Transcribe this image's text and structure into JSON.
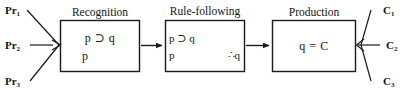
{
  "diagram": {
    "background_color": "#ffffff",
    "stroke_color": "#1a1a1a",
    "premises": [
      {
        "label": "Pr",
        "subscript": "1"
      },
      {
        "label": "Pr",
        "subscript": "2"
      },
      {
        "label": "Pr",
        "subscript": "3"
      }
    ],
    "conclusions": [
      {
        "label": "C",
        "subscript": "1"
      },
      {
        "label": "C",
        "subscript": "2"
      },
      {
        "label": "C",
        "subscript": "3"
      }
    ],
    "stages": [
      {
        "title": "Recognition",
        "lines": [
          {
            "text": "p ⊃ q",
            "align": "center"
          },
          {
            "text": "p",
            "align": "left"
          }
        ]
      },
      {
        "title": "Rule-following",
        "lines": [
          {
            "text": "p ⊃ q",
            "align": "left"
          },
          {
            "text": "p",
            "align": "left"
          },
          {
            "text": "∴q",
            "align": "right"
          }
        ]
      },
      {
        "title": "Production",
        "lines": [
          {
            "text": "q = C",
            "align": "center"
          }
        ]
      }
    ],
    "connectors": {
      "stage1_to_stage2": "arrow-right",
      "stage2_to_stage3": "arrow-right",
      "premises_to_stage1": "converging-arrow",
      "stage3_to_conclusions": "diverging-lines"
    }
  }
}
